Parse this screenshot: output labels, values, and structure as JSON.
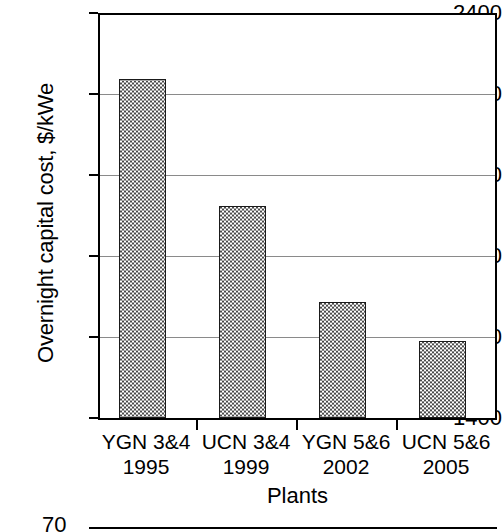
{
  "chart_data": {
    "type": "bar",
    "title": "",
    "xlabel": "Plants",
    "ylabel": "Overnight capital cost, $/kWe",
    "categories": [
      "YGN 3&4",
      "UCN 3&4",
      "YGN 5&6",
      "UCN 5&6"
    ],
    "category_sublabels": [
      "1995",
      "1999",
      "2002",
      "2005"
    ],
    "values": [
      2240,
      1925,
      1687,
      1592
    ],
    "ylim": [
      1400,
      2400
    ],
    "ytick_labels": [
      "2400",
      "2200",
      "2000",
      "1800",
      "1600",
      "1400"
    ],
    "ytick_values": [
      2400,
      2200,
      2000,
      1800,
      1600,
      1400
    ],
    "grid": true,
    "legend": "none",
    "bar_fill": "checkerboard",
    "bar_fill_color": "#4a4a4a",
    "bar_edge_color": "#1a1a1a",
    "axis_color": "#000000",
    "gridline_color": "#8a8a8a"
  },
  "next_figure_partial": {
    "ytick_label": "70"
  }
}
